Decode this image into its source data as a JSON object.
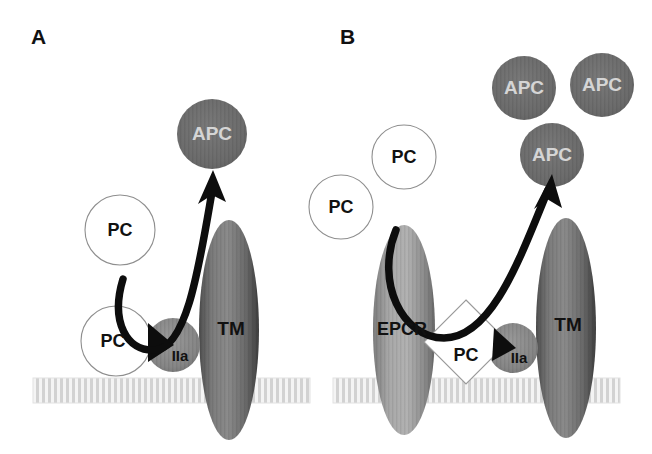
{
  "figure": {
    "background_color": "#ffffff",
    "width": 652,
    "height": 454
  },
  "panels": [
    {
      "id": "A",
      "label": "A",
      "label_x": 31,
      "label_y": 44,
      "membrane": {
        "x": 33,
        "y": 378,
        "width": 277,
        "height": 25
      },
      "shapes": [
        {
          "name": "apc-circle",
          "kind": "circle",
          "label": "APC",
          "cx": 212,
          "cy": 134,
          "rx": 35,
          "ry": 35,
          "fill": "#6c6c6c",
          "text_color": "#d5d5d5",
          "text_class": "lbl-apc"
        },
        {
          "name": "pc-circle-upper",
          "kind": "circle",
          "label": "PC",
          "cx": 120,
          "cy": 230,
          "rx": 35,
          "ry": 35,
          "fill": "#ffffff",
          "text_color": "#111111",
          "text_class": "lbl-pc"
        },
        {
          "name": "pc-circle-lower",
          "kind": "circle",
          "label": "PC",
          "cx": 116,
          "cy": 341,
          "rx": 35,
          "ry": 35,
          "fill": "#ffffff",
          "text_color": "#111111",
          "text_class": "lbl-pc"
        },
        {
          "name": "iia-circle",
          "kind": "circle",
          "label": "IIa",
          "cx": 173,
          "cy": 345,
          "rx": 27,
          "ry": 27,
          "fill": "#8a8a8a",
          "text_color": "#111111",
          "text_class": "lbl-iia"
        },
        {
          "name": "tm-ellipse",
          "kind": "ellipse",
          "label": "TM",
          "cx": 229,
          "cy": 330,
          "rx": 30,
          "ry": 110,
          "fill": "#6d6d6d",
          "text_color": "#111111",
          "text_class": "lbl-tm"
        }
      ],
      "arrow": {
        "name": "activation-arrow",
        "path": "M 123 279 C 110 322, 127 352, 155 350 C 188 348, 200 260, 213 186",
        "head_points": "213,172 225,200 212,194 199,202"
      },
      "wedge": {
        "name": "cleavage-wedge",
        "points": "148,323 174,345 148,362"
      }
    },
    {
      "id": "B",
      "label": "B",
      "label_x": 340,
      "label_y": 44,
      "membrane": {
        "x": 333,
        "y": 378,
        "width": 287,
        "height": 25
      },
      "shapes": [
        {
          "name": "apc-circle-top-left",
          "kind": "circle",
          "label": "APC",
          "cx": 524,
          "cy": 88,
          "rx": 32,
          "ry": 32,
          "fill": "#6c6c6c",
          "text_color": "#d5d5d5",
          "text_class": "lbl-apc"
        },
        {
          "name": "apc-circle-top-right",
          "kind": "circle",
          "label": "APC",
          "cx": 602,
          "cy": 85,
          "rx": 32,
          "ry": 32,
          "fill": "#6c6c6c",
          "text_color": "#d5d5d5",
          "text_class": "lbl-apc"
        },
        {
          "name": "apc-circle-middle",
          "kind": "circle",
          "label": "APC",
          "cx": 552,
          "cy": 155,
          "rx": 32,
          "ry": 32,
          "fill": "#6c6c6c",
          "text_color": "#d5d5d5",
          "text_class": "lbl-apc"
        },
        {
          "name": "pc-circle-upper",
          "kind": "circle",
          "label": "PC",
          "cx": 404,
          "cy": 157,
          "rx": 32,
          "ry": 32,
          "fill": "#ffffff",
          "text_color": "#111111",
          "text_class": "lbl-pc"
        },
        {
          "name": "pc-circle-lower",
          "kind": "circle",
          "label": "PC",
          "cx": 341,
          "cy": 207,
          "rx": 32,
          "ry": 32,
          "fill": "#ffffff",
          "text_color": "#111111",
          "text_class": "lbl-pc"
        },
        {
          "name": "epcr-ellipse",
          "kind": "ellipse",
          "label": "EPCR",
          "cx": 404,
          "cy": 330,
          "rx": 31,
          "ry": 105,
          "fill": "#9a9a9a",
          "text_color": "#111111",
          "text_class": "lbl-epcr"
        },
        {
          "name": "iia-circle",
          "kind": "circle",
          "label": "IIa",
          "cx": 513,
          "cy": 348,
          "rx": 25,
          "ry": 25,
          "fill": "#8a8a8a",
          "text_color": "#111111",
          "text_class": "lbl-iia"
        },
        {
          "name": "tm-ellipse",
          "kind": "ellipse",
          "label": "TM",
          "cx": 566,
          "cy": 328,
          "rx": 30,
          "ry": 110,
          "fill": "#6d6d6d",
          "text_color": "#111111",
          "text_class": "lbl-tm"
        }
      ],
      "diamond": {
        "name": "pc-diamond",
        "label": "PC",
        "cx": 466,
        "cy": 342,
        "half_w": 42,
        "half_h": 42,
        "text_dx": 0,
        "text_dy": 14
      },
      "arrow": {
        "name": "activation-arrow",
        "path": "M 396 230 C 375 282, 402 338, 444 338 C 492 338, 520 260, 548 190",
        "head_points": "551,176 560,206 547,198 535,207"
      },
      "wedge": {
        "name": "cleavage-wedge",
        "points": "494,330 514,348 492,360"
      }
    }
  ],
  "legend_terms": {
    "PC": "Protein C",
    "APC": "Activated Protein C",
    "IIa": "Thrombin",
    "TM": "Thrombomodulin",
    "EPCR": "Endothelial Protein C Receptor"
  },
  "colors": {
    "apc_fill": "#6c6c6c",
    "iia_fill": "#8a8a8a",
    "tm_fill": "#6d6d6d",
    "epcr_fill": "#9a9a9a",
    "pc_fill": "#ffffff",
    "membrane": "#d8d8d8",
    "arrow": "#0d0d0d",
    "text_dark": "#111111",
    "text_light": "#d5d5d5"
  }
}
